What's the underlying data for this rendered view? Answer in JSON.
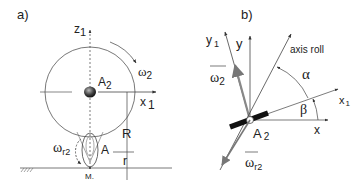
{
  "panel_a": {
    "label": "a)",
    "axis_z": "z",
    "axis_z_sub": "1",
    "axis_x": "x",
    "axis_x_sub": "1",
    "center_label": "A",
    "center_label_sub": "2",
    "omega_label": "ω",
    "omega_sub": "2",
    "omega_r_label": "ω",
    "omega_r_sub": "r2",
    "point_A": "A",
    "big_radius": "R",
    "small_radius": "r",
    "contact_point": "M."
  },
  "panel_b": {
    "label": "b)",
    "axis_y1": "y",
    "axis_y1_sub": "1",
    "axis_y": "y",
    "axis_roll": "axis roll",
    "axis_x1": "x",
    "axis_x1_sub": "1",
    "axis_x": "x",
    "angle_alpha": "α",
    "angle_beta": "β",
    "omega_label": "ω",
    "omega_sub": "2",
    "origin_label": "A",
    "origin_sub": "2",
    "omega_r_label": "ω",
    "omega_r_sub": "r2"
  },
  "colors": {
    "line": "#333333",
    "gray_vector": "#888888",
    "bar": "#111111"
  }
}
